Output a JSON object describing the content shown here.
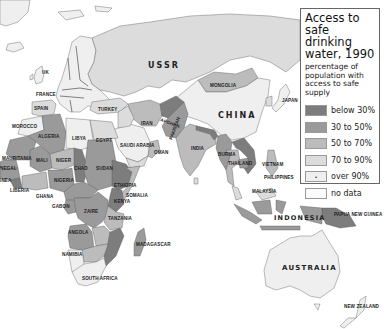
{
  "legend": {
    "title": "Access to safe drinking water, 1990",
    "subtitle": "percentage of population with access to safe supply",
    "items": [
      {
        "label": "below 30%",
        "color": "#7d7d7d",
        "marker": ""
      },
      {
        "label": "30 to 50%",
        "color": "#9a9a9a",
        "marker": ""
      },
      {
        "label": "50 to 70%",
        "color": "#bcbcbc",
        "marker": ""
      },
      {
        "label": "70 to 90%",
        "color": "#dcdcdc",
        "marker": ""
      },
      {
        "label": "over 90%",
        "color": "#efefef",
        "marker": "•"
      },
      {
        "label": "no data",
        "color": "#fbfbfb",
        "marker": ""
      }
    ]
  },
  "labels": {
    "uk": "UK",
    "france": "FRANCE",
    "spain": "SPAIN",
    "turkey": "TURKEY",
    "ussr": "USSR",
    "mongolia": "MONGOLIA",
    "china": "CHINA",
    "japan": "JAPAN",
    "iran": "IRAN",
    "afghanistan": "AFGHAN.",
    "pakistan": "PAKISTAN",
    "india": "INDIA",
    "saudi_arabia": "SAUDI ARABIA",
    "oman": "OMAN",
    "burma": "BURMA",
    "thailand": "THAILAND",
    "vietnam": "VIETNAM",
    "philippines": "PHILIPPINES",
    "malaysia": "MALAYSIA",
    "indonesia": "INDONESIA",
    "papua": "PAPUA NEW GUINEA",
    "australia": "AUSTRALIA",
    "new_zealand": "NEW ZEALAND",
    "morocco": "MOROCCO",
    "algeria": "ALGERIA",
    "libya": "LIBYA",
    "egypt": "EGYPT",
    "mauritania": "MAURITANIA",
    "mali": "MALI",
    "niger": "NIGER",
    "chad": "CHAD",
    "sudan": "SUDAN",
    "senegal": "NEGAL",
    "guinea": "INEA",
    "liberia": "LIBERIA",
    "ghana": "GHANA",
    "nigeria": "NIGERIA",
    "ethiopia": "ETHIOPIA",
    "somalia": "SOMALIA",
    "kenya": "KENYA",
    "gabon": "GABON",
    "zaire": "ZAIRE",
    "tanzania": "TANZANIA",
    "angola": "ANGOLA",
    "namibia": "NAMIBIA",
    "madagascar": "MADAGASCAR",
    "south_africa": "SOUTH AFRICA"
  }
}
